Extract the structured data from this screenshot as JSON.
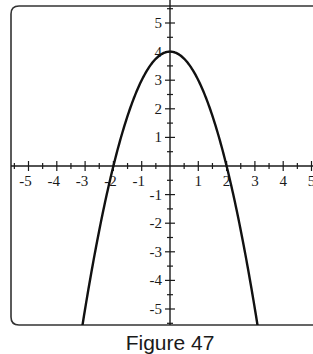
{
  "caption": "Figure 47",
  "chart_data": {
    "type": "line",
    "title": "",
    "caption": "Figure 47",
    "xlabel": "",
    "ylabel": "",
    "xlim": [
      -5.5,
      5
    ],
    "ylim": [
      -5.6,
      5.6
    ],
    "grid": false,
    "legend": null,
    "x_tick_labels": [
      "-5",
      "-4",
      "-3",
      "-2",
      "-1",
      "1",
      "2",
      "3",
      "4",
      "5"
    ],
    "x_ticks": [
      -5,
      -4,
      -3,
      -2,
      -1,
      1,
      2,
      3,
      4,
      5
    ],
    "y_tick_labels": [
      "5",
      "4",
      "3",
      "2",
      "1",
      "-1",
      "-2",
      "-3",
      "-4",
      "-5"
    ],
    "y_ticks": [
      5,
      4,
      3,
      2,
      1,
      -1,
      -2,
      -3,
      -4,
      -5
    ],
    "minor_tick_step": 0.5,
    "series": [
      {
        "name": "y = 4 - x^2",
        "color": "#111111",
        "x": [
          -3.1,
          -3,
          -2.5,
          -2,
          -1.5,
          -1,
          -0.5,
          0,
          0.5,
          1,
          1.5,
          2,
          2.5,
          3,
          3.1
        ],
        "y": [
          -5.61,
          -5,
          -2.25,
          0,
          1.75,
          3,
          3.75,
          4,
          3.75,
          3,
          1.75,
          0,
          -2.25,
          -5,
          -5.61
        ]
      }
    ],
    "annotations": {
      "vertex": [
        0,
        4
      ],
      "x_intercepts": [
        -2,
        2
      ]
    }
  },
  "colors": {
    "axis": "#1a1a1a",
    "frame": "#333333",
    "curve": "#111111",
    "background": "#ffffff"
  }
}
